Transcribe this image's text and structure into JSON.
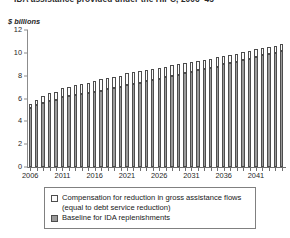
{
  "chart_data": {
    "type": "bar",
    "title": "IDA assistance provided under the HIPC, 2006–45",
    "ylabel": "$ billions",
    "xlabel": "",
    "ylim": [
      0,
      12
    ],
    "yticks": [
      0,
      2,
      4,
      6,
      8,
      10,
      12
    ],
    "xtick_labels": [
      "2006",
      "2011",
      "2016",
      "2021",
      "2026",
      "2031",
      "2036",
      "2041"
    ],
    "xtick_years": [
      2006,
      2011,
      2016,
      2021,
      2026,
      2031,
      2036,
      2041
    ],
    "grid": false,
    "stacked": true,
    "legend_position": "below",
    "categories": [
      "2006",
      "2007",
      "2008",
      "2009",
      "2010",
      "2011",
      "2012",
      "2013",
      "2014",
      "2015",
      "2016",
      "2017",
      "2018",
      "2019",
      "2020",
      "2021",
      "2022",
      "2023",
      "2024",
      "2025",
      "2026",
      "2027",
      "2028",
      "2029",
      "2030",
      "2031",
      "2032",
      "2033",
      "2034",
      "2035",
      "2036",
      "2037",
      "2038",
      "2039",
      "2040",
      "2041",
      "2042",
      "2043",
      "2044",
      "2045"
    ],
    "series": [
      {
        "name": "Baseline for IDA replenishments",
        "color": "#9a9a9a",
        "values": [
          5.2,
          5.4,
          5.6,
          5.8,
          5.9,
          6.1,
          6.2,
          6.3,
          6.4,
          6.5,
          6.6,
          6.7,
          6.8,
          6.9,
          7.0,
          7.2,
          7.3,
          7.4,
          7.5,
          7.6,
          7.7,
          7.9,
          8.0,
          8.1,
          8.2,
          8.3,
          8.5,
          8.6,
          8.7,
          8.8,
          9.0,
          9.1,
          9.2,
          9.4,
          9.5,
          9.6,
          9.8,
          9.9,
          10.0,
          10.2
        ]
      },
      {
        "name": "Compensation for reduction in gross assistance flows (equal to debt service reduction)",
        "color": "#fbfbfb",
        "values": [
          0.3,
          0.5,
          0.6,
          0.7,
          0.7,
          0.8,
          0.8,
          0.9,
          0.9,
          0.9,
          0.9,
          1.0,
          1.0,
          1.0,
          1.0,
          1.0,
          1.0,
          1.0,
          1.0,
          1.0,
          1.0,
          0.9,
          0.9,
          0.9,
          0.9,
          0.9,
          0.8,
          0.8,
          0.8,
          0.8,
          0.7,
          0.7,
          0.7,
          0.7,
          0.7,
          0.7,
          0.6,
          0.6,
          0.6,
          0.6
        ]
      }
    ],
    "totals": [
      5.5,
      5.9,
      6.2,
      6.5,
      6.6,
      6.9,
      7.0,
      7.2,
      7.3,
      7.4,
      7.5,
      7.7,
      7.8,
      7.9,
      8.0,
      8.2,
      8.3,
      8.4,
      8.5,
      8.6,
      8.7,
      8.8,
      8.9,
      9.0,
      9.1,
      9.2,
      9.3,
      9.4,
      9.5,
      9.6,
      9.7,
      9.8,
      9.9,
      10.1,
      10.2,
      10.3,
      10.4,
      10.5,
      10.6,
      10.8
    ]
  },
  "legend": {
    "items": [
      {
        "swatch": "compensation-swatch",
        "label": "Compensation for reduction in gross assistance flows (equal to debt service reduction)"
      },
      {
        "swatch": "baseline-swatch",
        "label": "Baseline for IDA replenishments"
      }
    ]
  },
  "colors": {
    "baseline": "#9a9a9a",
    "compensation": "#fbfbfb",
    "outline": "#4d4d4d",
    "axis": "#6e6e6e"
  }
}
